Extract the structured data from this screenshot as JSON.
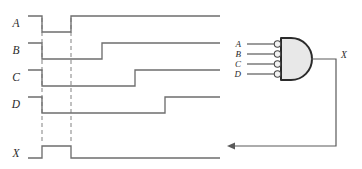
{
  "figure": {
    "colors": {
      "signal": "#6e6e6e",
      "marker": "#8d8d8d",
      "wire": "#5a5a5a",
      "gate_fill": "#e8e8e8",
      "gate_outline": "#2b2b2b",
      "bubble_fill": "#f2f2f2",
      "background": "#ffffff"
    }
  },
  "timing": {
    "signal_labels": [
      "A",
      "B",
      "C",
      "D",
      "X"
    ],
    "time_markers": [
      42,
      71
    ],
    "waveforms": [
      {
        "name": "A",
        "label": "A",
        "label_x": 16,
        "label_y": 27,
        "high_y": 16,
        "low_y": 32,
        "start_x": 28,
        "end_x": 220,
        "initial_level": "high",
        "transitions": [
          {
            "x": 42,
            "to": "low"
          },
          {
            "x": 71,
            "to": "high"
          }
        ]
      },
      {
        "name": "B",
        "label": "B",
        "label_x": 16,
        "label_y": 54,
        "high_y": 43,
        "low_y": 59,
        "start_x": 28,
        "end_x": 220,
        "initial_level": "high",
        "transitions": [
          {
            "x": 42,
            "to": "low"
          },
          {
            "x": 102,
            "to": "high"
          }
        ]
      },
      {
        "name": "C",
        "label": "C",
        "label_x": 16,
        "label_y": 81,
        "high_y": 70,
        "low_y": 86,
        "start_x": 28,
        "end_x": 220,
        "initial_level": "high",
        "transitions": [
          {
            "x": 42,
            "to": "low"
          },
          {
            "x": 135,
            "to": "high"
          }
        ]
      },
      {
        "name": "D",
        "label": "D",
        "label_x": 16,
        "label_y": 108,
        "high_y": 97,
        "low_y": 113,
        "start_x": 28,
        "end_x": 220,
        "initial_level": "high",
        "transitions": [
          {
            "x": 42,
            "to": "low"
          },
          {
            "x": 165,
            "to": "high"
          }
        ]
      },
      {
        "name": "X",
        "label": "X",
        "label_x": 16,
        "label_y": 157,
        "high_y": 146,
        "low_y": 158,
        "start_x": 28,
        "end_x": 220,
        "initial_level": "low",
        "transitions": [
          {
            "x": 42,
            "to": "high"
          },
          {
            "x": 71,
            "to": "low"
          }
        ]
      }
    ]
  },
  "circuit": {
    "gate_type": "nor",
    "gate_description": "AND shape with inverting bubbles on all four inputs",
    "input_labels": [
      "A",
      "B",
      "C",
      "D"
    ],
    "input_label_x": 241,
    "input_rows_y": [
      44,
      54,
      64,
      74
    ],
    "input_line_start_x": 247,
    "input_line_end_x": 274,
    "bubble_cx": 277.5,
    "bubble_r": 3.2,
    "gate_left_x": 281,
    "gate_top_y": 38,
    "gate_bottom_y": 80,
    "gate_nose_x": 312,
    "output_label": "X",
    "output_label_x": 341,
    "output_label_y": 58,
    "output_wire": {
      "from_x": 312,
      "y": 59,
      "corner_x": 336,
      "down_to_y": 146,
      "arrow_x": 228
    }
  }
}
